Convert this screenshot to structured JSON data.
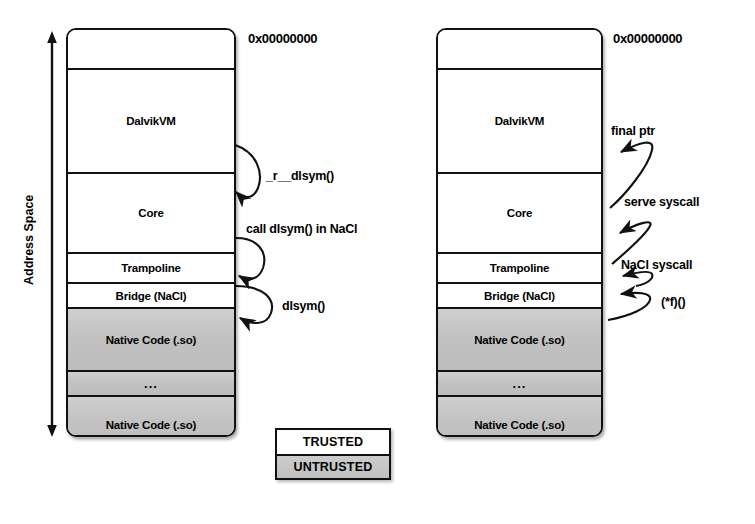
{
  "figure": {
    "axis_label": "Address Space"
  },
  "panels": [
    {
      "id": "left",
      "address_label": "0x00000000",
      "bands": [
        {
          "label": "",
          "trust": "trusted"
        },
        {
          "label": "DalvikVM",
          "trust": "trusted"
        },
        {
          "label": "Core",
          "trust": "trusted"
        },
        {
          "label": "Trampoline",
          "trust": "trusted"
        },
        {
          "label": "Bridge (NaCl)",
          "trust": "trusted"
        },
        {
          "label": "Native Code (.so)",
          "trust": "untrusted"
        },
        {
          "label": "...",
          "trust": "untrusted"
        },
        {
          "label": "Native Code (.so)",
          "trust": "untrusted"
        },
        {
          "label": "",
          "trust": "trusted"
        }
      ],
      "callouts": [
        {
          "text": "_r__dlsym()"
        },
        {
          "text": "call dlsym() in NaCl"
        },
        {
          "text": "dlsym()"
        }
      ]
    },
    {
      "id": "right",
      "address_label": "0x00000000",
      "bands": [
        {
          "label": "",
          "trust": "trusted"
        },
        {
          "label": "DalvikVM",
          "trust": "trusted"
        },
        {
          "label": "Core",
          "trust": "trusted"
        },
        {
          "label": "Trampoline",
          "trust": "trusted"
        },
        {
          "label": "Bridge (NaCl)",
          "trust": "trusted"
        },
        {
          "label": "Native Code (.so)",
          "trust": "untrusted"
        },
        {
          "label": "...",
          "trust": "untrusted"
        },
        {
          "label": "Native Code (.so)",
          "trust": "untrusted"
        },
        {
          "label": "",
          "trust": "trusted"
        }
      ],
      "callouts": [
        {
          "text": "final ptr"
        },
        {
          "text": "serve syscall"
        },
        {
          "text": "NaCl syscall"
        },
        {
          "text": "(*f)()"
        }
      ]
    }
  ],
  "legend": {
    "trusted_label": "TRUSTED",
    "untrusted_label": "UNTRUSTED",
    "trusted_color": "#ffffff",
    "untrusted_color": "#c4c4c4"
  }
}
